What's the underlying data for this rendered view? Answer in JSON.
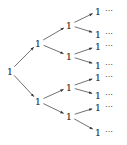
{
  "diagram": {
    "type": "binary-tree",
    "node_label": "1",
    "ellipsis": "⋯",
    "colors": {
      "ink": "#222222",
      "background": "#ffffff"
    },
    "nodes": [
      {
        "id": "root",
        "label": "1",
        "x": 10,
        "y": 71
      },
      {
        "id": "a",
        "label": "1",
        "x": 38,
        "y": 43
      },
      {
        "id": "b",
        "label": "1",
        "x": 38,
        "y": 101
      },
      {
        "id": "aa",
        "label": "1",
        "x": 69,
        "y": 25
      },
      {
        "id": "ab",
        "label": "1",
        "x": 69,
        "y": 56
      },
      {
        "id": "ba",
        "label": "1",
        "x": 69,
        "y": 87
      },
      {
        "id": "bb",
        "label": "1",
        "x": 69,
        "y": 116
      },
      {
        "id": "aaa",
        "label": "1",
        "x": 98,
        "y": 11
      },
      {
        "id": "aab",
        "label": "1",
        "x": 98,
        "y": 34
      },
      {
        "id": "aba",
        "label": "1",
        "x": 98,
        "y": 46
      },
      {
        "id": "abb",
        "label": "1",
        "x": 98,
        "y": 65
      },
      {
        "id": "baa",
        "label": "1",
        "x": 98,
        "y": 77
      },
      {
        "id": "bab",
        "label": "1",
        "x": 98,
        "y": 95
      },
      {
        "id": "bba",
        "label": "1",
        "x": 98,
        "y": 107
      },
      {
        "id": "bbb",
        "label": "1",
        "x": 98,
        "y": 132
      }
    ],
    "edges": [
      [
        "root",
        "a"
      ],
      [
        "root",
        "b"
      ],
      [
        "a",
        "aa"
      ],
      [
        "a",
        "ab"
      ],
      [
        "b",
        "ba"
      ],
      [
        "b",
        "bb"
      ],
      [
        "aa",
        "aaa"
      ],
      [
        "aa",
        "aab"
      ],
      [
        "ab",
        "aba"
      ],
      [
        "ab",
        "abb"
      ],
      [
        "ba",
        "baa"
      ],
      [
        "ba",
        "bab"
      ],
      [
        "bb",
        "bba"
      ],
      [
        "bb",
        "bbb"
      ]
    ]
  }
}
